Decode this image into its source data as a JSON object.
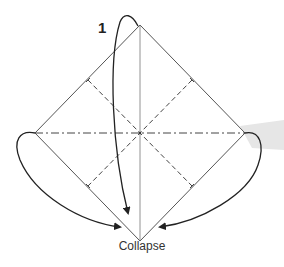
{
  "diagram": {
    "step_number": "1",
    "caption": "Collapse",
    "colors": {
      "edge": "#555555",
      "crease": "#444444",
      "arrow": "#222222",
      "shadow": "#e6e6e6"
    },
    "elements": {
      "square_outline": "diamond-oriented paper square",
      "vertical_crease": "thin solid center line",
      "horizontal_crease": "dash-dot mountain fold",
      "diagonal_creases": "dashed valley folds (x2)",
      "arrows": [
        "top corner to bottom",
        "left corner to bottom",
        "right corner to bottom"
      ]
    }
  }
}
